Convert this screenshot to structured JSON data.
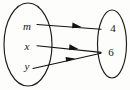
{
  "diagram": {
    "type": "mapping-diagram",
    "stroke_color": "#121212",
    "background_color": "#fdfdfc",
    "domain_set": {
      "name": "domain",
      "shape": "ellipse",
      "elements": [
        {
          "label": "m",
          "style": "italic",
          "cx": 27,
          "cy": 26
        },
        {
          "label": "x",
          "style": "italic",
          "cx": 27,
          "cy": 46
        },
        {
          "label": "y",
          "style": "italic",
          "cx": 27,
          "cy": 66
        }
      ]
    },
    "range_set": {
      "name": "range",
      "shape": "ellipse",
      "elements": [
        {
          "label": "4",
          "style": "normal",
          "cx": 113,
          "cy": 28
        },
        {
          "label": "6",
          "style": "normal",
          "cx": 111,
          "cy": 52
        }
      ]
    },
    "arrows": [
      {
        "from": "m",
        "to": "4",
        "x1": 37,
        "y1": 25,
        "x2": 101,
        "y2": 29
      },
      {
        "from": "x",
        "to": "6",
        "x1": 37,
        "y1": 46,
        "x2": 101,
        "y2": 52
      },
      {
        "from": "y",
        "to": "6",
        "x1": 33,
        "y1": 68,
        "x2": 101,
        "y2": 53
      }
    ]
  }
}
